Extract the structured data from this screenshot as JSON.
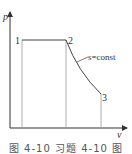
{
  "diagram": {
    "type": "p-v diagram",
    "axes": {
      "y_label": "p",
      "x_label": "v"
    },
    "points": [
      {
        "label": "1",
        "x": 22,
        "y": 40
      },
      {
        "label": "2",
        "x": 66,
        "y": 40
      },
      {
        "label": "3",
        "x": 101,
        "y": 94
      }
    ],
    "curve_label": "s=const",
    "caption": "图 4-10   习题 4-10 图"
  }
}
